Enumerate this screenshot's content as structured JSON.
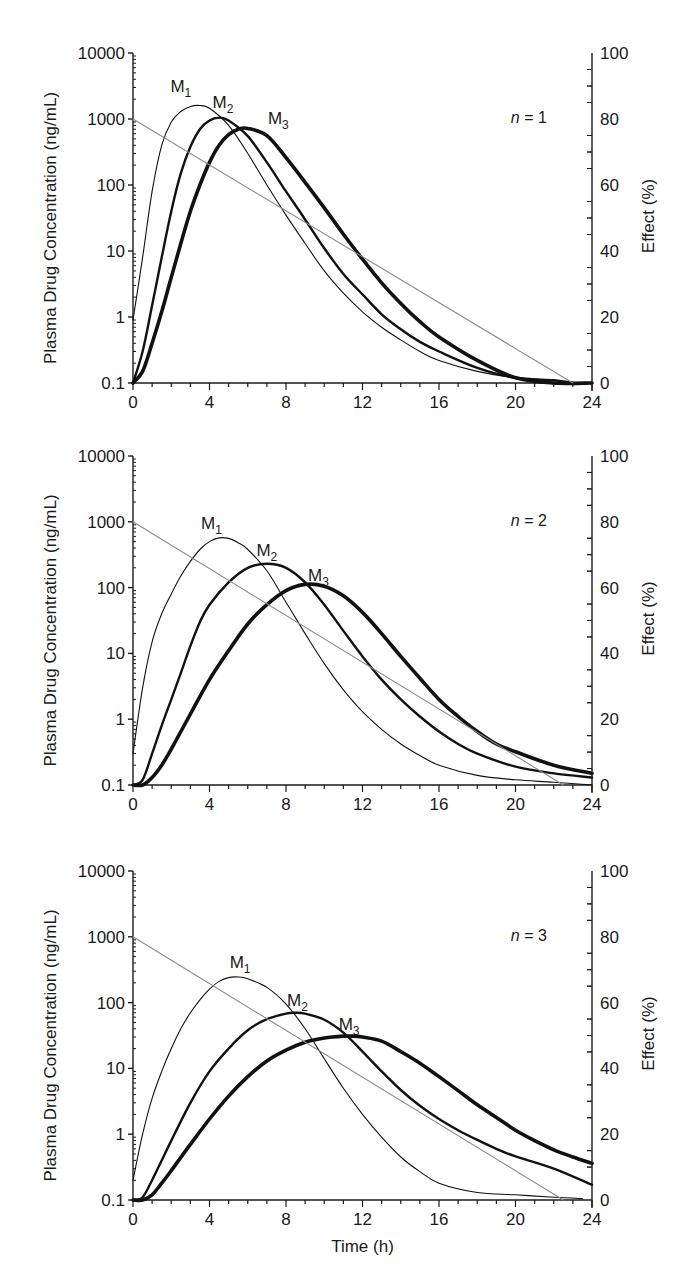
{
  "chart_data": [
    {
      "type": "line",
      "panel_label": "n = 1",
      "n_value": "1",
      "xlabel": "",
      "ylabel": "Plasma Drug Concentration (ng/mL)",
      "ylabel_right": "Effect (%)",
      "yscale": "log",
      "ylim": [
        0.1,
        10000
      ],
      "ylim_right": [
        0,
        100
      ],
      "xlim": [
        0,
        24
      ],
      "x_ticks": [
        0,
        4,
        8,
        12,
        16,
        20,
        24
      ],
      "y_ticks": [
        "0.1",
        "1",
        "10",
        "100",
        "1000",
        "10000"
      ],
      "y_ticks_right": [
        0,
        20,
        40,
        60,
        80,
        100
      ],
      "grid": false,
      "series": [
        {
          "name": "M1",
          "style": "thin",
          "x": [
            0,
            0.5,
            1,
            1.5,
            2,
            2.5,
            3,
            3.5,
            4,
            5,
            6,
            7,
            8,
            9,
            10,
            11,
            12,
            13,
            14,
            15,
            16,
            18,
            20,
            22,
            23
          ],
          "y": [
            0.9,
            8,
            80,
            400,
            900,
            1300,
            1550,
            1600,
            1450,
            800,
            300,
            100,
            35,
            13,
            5,
            2.3,
            1.2,
            0.7,
            0.45,
            0.3,
            0.22,
            0.15,
            0.12,
            0.11,
            0.1
          ]
        },
        {
          "name": "M2",
          "style": "medium",
          "x": [
            0,
            0.5,
            1,
            1.5,
            2,
            2.5,
            3,
            3.5,
            4,
            4.5,
            5,
            6,
            7,
            8,
            9,
            10,
            11,
            12,
            13,
            14,
            15,
            16,
            18,
            20,
            22,
            23
          ],
          "y": [
            0.1,
            0.3,
            1.5,
            8,
            40,
            150,
            380,
            700,
            950,
            1050,
            950,
            550,
            220,
            80,
            30,
            11,
            4.5,
            2.2,
            1.1,
            0.65,
            0.42,
            0.3,
            0.17,
            0.12,
            0.11,
            0.1
          ]
        },
        {
          "name": "M3",
          "style": "thick",
          "x": [
            0,
            0.5,
            1,
            1.5,
            2,
            2.5,
            3,
            3.5,
            4,
            4.5,
            5,
            5.5,
            6,
            7,
            8,
            9,
            10,
            11,
            12,
            13,
            14,
            15,
            16,
            18,
            20,
            22,
            24
          ],
          "y": [
            0.1,
            0.15,
            0.4,
            1.2,
            4,
            13,
            40,
            100,
            220,
            400,
            580,
            700,
            720,
            560,
            260,
            110,
            45,
            18,
            7.5,
            3.3,
            1.6,
            0.85,
            0.5,
            0.22,
            0.12,
            0.1,
            0.1
          ]
        },
        {
          "name": "Effect",
          "style": "gray",
          "axis": "right",
          "x": [
            0,
            23
          ],
          "y": [
            80,
            0
          ]
        }
      ],
      "annotations": [
        "M1",
        "M2",
        "M3",
        "n = 1"
      ]
    },
    {
      "type": "line",
      "panel_label": "n = 2",
      "n_value": "2",
      "xlabel": "",
      "ylabel": "Plasma Drug Concentration (ng/mL)",
      "ylabel_right": "Effect (%)",
      "yscale": "log",
      "ylim": [
        0.1,
        10000
      ],
      "ylim_right": [
        0,
        100
      ],
      "xlim": [
        0,
        24
      ],
      "x_ticks": [
        0,
        4,
        8,
        12,
        16,
        20,
        24
      ],
      "y_ticks": [
        "0.1",
        "1",
        "10",
        "100",
        "1000",
        "10000"
      ],
      "y_ticks_right": [
        0,
        20,
        40,
        60,
        80,
        100
      ],
      "grid": false,
      "series": [
        {
          "name": "M1",
          "style": "thin",
          "x": [
            0,
            0.5,
            1,
            1.5,
            2,
            2.5,
            3,
            3.5,
            4,
            4.5,
            5,
            5.5,
            6,
            7,
            8,
            9,
            10,
            11,
            12,
            13,
            14,
            15,
            16,
            18,
            20,
            22,
            24
          ],
          "y": [
            0.3,
            3,
            15,
            40,
            80,
            150,
            250,
            380,
            500,
            570,
            560,
            480,
            380,
            180,
            60,
            20,
            7,
            2.8,
            1.3,
            0.7,
            0.42,
            0.28,
            0.2,
            0.14,
            0.12,
            0.11,
            0.1
          ]
        },
        {
          "name": "M2",
          "style": "medium",
          "x": [
            0,
            0.5,
            1,
            1.5,
            2,
            2.5,
            3,
            3.5,
            4,
            5,
            6,
            7,
            8,
            9,
            10,
            11,
            12,
            13,
            14,
            15,
            16,
            17,
            18,
            20,
            22,
            24
          ],
          "y": [
            0.1,
            0.12,
            0.3,
            0.8,
            2,
            5,
            13,
            30,
            55,
            120,
            200,
            230,
            200,
            120,
            55,
            22,
            9,
            4,
            2,
            1.1,
            0.65,
            0.42,
            0.3,
            0.19,
            0.15,
            0.13
          ]
        },
        {
          "name": "M3",
          "style": "thick",
          "x": [
            0,
            0.5,
            1,
            1.5,
            2,
            3,
            4,
            5,
            6,
            7,
            8,
            9,
            10,
            11,
            12,
            13,
            14,
            15,
            16,
            17,
            18,
            19,
            20,
            22,
            24
          ],
          "y": [
            0.1,
            0.1,
            0.13,
            0.2,
            0.35,
            1.2,
            4,
            11,
            28,
            55,
            90,
            112,
            105,
            75,
            42,
            20,
            9,
            4.2,
            2,
            1.1,
            0.65,
            0.42,
            0.32,
            0.2,
            0.15
          ]
        },
        {
          "name": "Effect",
          "style": "gray",
          "axis": "right",
          "x": [
            0,
            22.5
          ],
          "y": [
            80,
            0
          ]
        }
      ],
      "annotations": [
        "M1",
        "M2",
        "M3",
        "n = 2"
      ]
    },
    {
      "type": "line",
      "panel_label": "n = 3",
      "n_value": "3",
      "xlabel": "Time (h)",
      "ylabel": "Plasma Drug Concentration (ng/mL)",
      "ylabel_right": "Effect (%)",
      "yscale": "log",
      "ylim": [
        0.1,
        10000
      ],
      "ylim_right": [
        0,
        100
      ],
      "xlim": [
        0,
        24
      ],
      "x_ticks": [
        0,
        4,
        8,
        12,
        16,
        20,
        24
      ],
      "y_ticks": [
        "0.1",
        "1",
        "10",
        "100",
        "1000",
        "10000"
      ],
      "y_ticks_right": [
        0,
        20,
        40,
        60,
        80,
        100
      ],
      "grid": false,
      "series": [
        {
          "name": "M1",
          "style": "thin",
          "x": [
            0,
            0.5,
            1,
            1.5,
            2,
            2.5,
            3,
            3.5,
            4,
            4.5,
            5,
            5.5,
            6,
            7,
            8,
            9,
            10,
            11,
            12,
            13,
            14,
            15,
            16,
            18,
            20,
            22,
            23.5
          ],
          "y": [
            0.2,
            1,
            3.5,
            9,
            20,
            40,
            70,
            110,
            160,
            210,
            240,
            245,
            230,
            170,
            95,
            40,
            14,
            5,
            2,
            0.9,
            0.45,
            0.27,
            0.18,
            0.13,
            0.12,
            0.11,
            0.105
          ]
        },
        {
          "name": "M2",
          "style": "medium",
          "x": [
            0,
            0.5,
            1,
            1.5,
            2,
            3,
            4,
            5,
            6,
            7,
            8,
            8.5,
            9,
            10,
            11,
            12,
            13,
            14,
            15,
            16,
            17,
            18,
            19,
            20,
            22,
            24
          ],
          "y": [
            0.1,
            0.11,
            0.2,
            0.4,
            0.8,
            3,
            9,
            20,
            38,
            56,
            68,
            70,
            68,
            55,
            35,
            18,
            9,
            4.7,
            2.7,
            1.7,
            1.15,
            0.82,
            0.6,
            0.46,
            0.3,
            0.17
          ]
        },
        {
          "name": "M3",
          "style": "thick",
          "x": [
            0,
            0.5,
            1,
            1.5,
            2,
            3,
            4,
            5,
            6,
            7,
            8,
            9,
            10,
            11,
            11.5,
            12,
            13,
            14,
            15,
            16,
            17,
            18,
            19,
            20,
            21,
            22,
            23,
            24
          ],
          "y": [
            0.1,
            0.1,
            0.12,
            0.18,
            0.28,
            0.7,
            1.7,
            3.8,
            7.5,
            13,
            19,
            25,
            29,
            31,
            31,
            30,
            26,
            18,
            12,
            7.5,
            4.6,
            2.8,
            1.8,
            1.15,
            0.8,
            0.58,
            0.45,
            0.36
          ]
        },
        {
          "name": "Effect",
          "style": "gray",
          "axis": "right",
          "x": [
            0,
            22.5
          ],
          "y": [
            80,
            0
          ]
        }
      ],
      "annotations": [
        "M1",
        "M2",
        "M3",
        "n = 3"
      ]
    }
  ],
  "panels": [
    {
      "n_italic": "n",
      "n_rest": " = 1",
      "labels": [
        {
          "main": "M",
          "sub": "1",
          "x": 2.5,
          "yval": 2600
        },
        {
          "main": "M",
          "sub": "2",
          "x": 4.7,
          "yval": 1450
        },
        {
          "main": "M",
          "sub": "3",
          "x": 7.6,
          "yval": 850
        }
      ]
    },
    {
      "n_italic": "n",
      "n_rest": " = 2",
      "labels": [
        {
          "main": "M",
          "sub": "1",
          "x": 4.1,
          "yval": 780
        },
        {
          "main": "M",
          "sub": "2",
          "x": 7.0,
          "yval": 300
        },
        {
          "main": "M",
          "sub": "3",
          "x": 9.7,
          "yval": 125
        }
      ]
    },
    {
      "n_italic": "n",
      "n_rest": " = 3",
      "labels": [
        {
          "main": "M",
          "sub": "1",
          "x": 5.6,
          "yval": 330
        },
        {
          "main": "M",
          "sub": "2",
          "x": 8.6,
          "yval": 90
        },
        {
          "main": "M",
          "sub": "3",
          "x": 11.3,
          "yval": 38
        }
      ]
    }
  ],
  "axis_text": {
    "left_title": "Plasma Drug Concentration (ng/mL)",
    "right_title": "Effect (%)",
    "bottom_title": "Time (h)"
  },
  "colors": {
    "curve": "#111111",
    "effect_line": "#8a8a8a",
    "axis": "#1a1a1a"
  }
}
